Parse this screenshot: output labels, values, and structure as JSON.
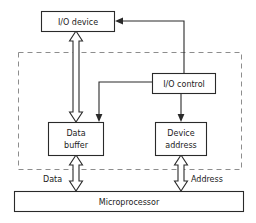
{
  "diagram": {
    "type": "block-diagram",
    "colors": {
      "background": "#ffffff",
      "box_stroke": "#2a2a2a",
      "box_fill": "#ffffff",
      "region_stroke": "#8d8d8d",
      "text": "#1b1b1b"
    },
    "boxes": [
      {
        "id": "io_device",
        "label": "I/O device"
      },
      {
        "id": "io_control",
        "label": "I/O control"
      },
      {
        "id": "data_buffer",
        "label_line1": "Data",
        "label_line2": "buffer"
      },
      {
        "id": "device_address",
        "label_line1": "Device",
        "label_line2": "address"
      },
      {
        "id": "microprocessor",
        "label": "Microprocessor"
      }
    ],
    "bus_labels": [
      {
        "id": "data_bus",
        "label": "Data"
      },
      {
        "id": "address_bus",
        "label": "Address"
      }
    ],
    "connections": [
      {
        "id": "io-device-data-buffer-bus",
        "style": "hollow-double-arrow"
      },
      {
        "id": "data-buffer-cpu-bus",
        "style": "hollow-double-arrow"
      },
      {
        "id": "device-address-cpu-bus",
        "style": "hollow-double-arrow"
      },
      {
        "id": "io-control-to-io-device",
        "style": "thin-arrow"
      },
      {
        "id": "io-control-to-data-buffer",
        "style": "thin-arrow"
      },
      {
        "id": "io-control-to-device-address",
        "style": "thin-arrow"
      }
    ],
    "region": {
      "id": "io-interface-region",
      "style": "dashed"
    }
  }
}
